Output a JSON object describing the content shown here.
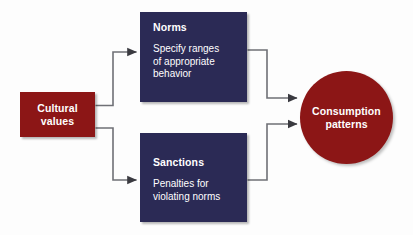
{
  "diagram": {
    "type": "flow-diagram",
    "background_color": "#fdfdfd",
    "palette": {
      "source_fill": "#8c1616",
      "process_fill": "#2b2a55",
      "outcome_fill": "#8c1616",
      "text_color": "#ffffff",
      "connector_color": "#6f7076"
    },
    "nodes": {
      "source": {
        "id": "cultural-values",
        "shape": "rectangle",
        "title": "Cultural\nvalues",
        "title_line_1": "Cultural",
        "title_line_2": "values",
        "fill": "#8c1616"
      },
      "norms": {
        "id": "norms",
        "shape": "rectangle",
        "title": "Norms",
        "description": "Specify ranges\nof appropriate\nbehavior",
        "fill": "#2b2a55"
      },
      "sanctions": {
        "id": "sanctions",
        "shape": "rectangle",
        "title": "Sanctions",
        "description": "Penalties for\nviolating norms",
        "fill": "#2b2a55"
      },
      "outcome": {
        "id": "consumption-patterns",
        "shape": "circle",
        "title": "Consumption\npatterns",
        "title_line_1": "Consumption",
        "title_line_2": "patterns",
        "fill": "#8c1616"
      }
    },
    "edges": [
      {
        "id": "edge-values-to-norms",
        "from": "cultural-values",
        "to": "norms",
        "style": "elbow",
        "arrowhead": "filled-triangle"
      },
      {
        "id": "edge-values-to-sanctions",
        "from": "cultural-values",
        "to": "sanctions",
        "style": "elbow",
        "arrowhead": "filled-triangle"
      },
      {
        "id": "edge-norms-to-outcome",
        "from": "norms",
        "to": "consumption-patterns",
        "style": "elbow",
        "arrowhead": "filled-triangle"
      },
      {
        "id": "edge-sanctions-to-outcome",
        "from": "sanctions",
        "to": "consumption-patterns",
        "style": "elbow",
        "arrowhead": "filled-triangle"
      }
    ]
  }
}
